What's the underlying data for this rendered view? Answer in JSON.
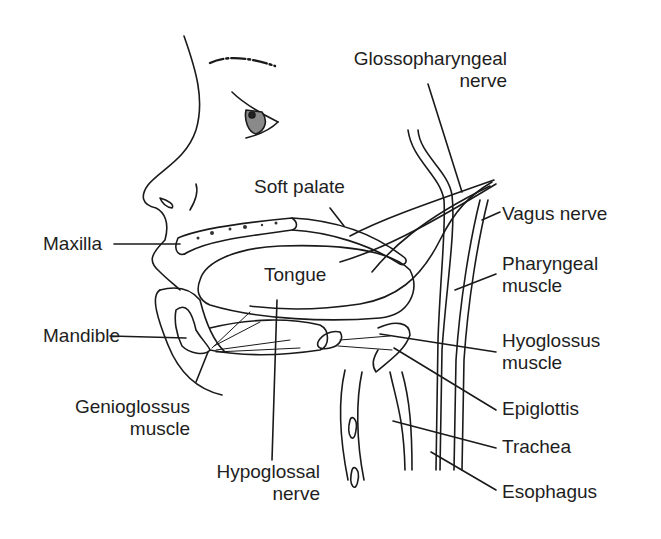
{
  "figure": {
    "background": "#ffffff",
    "line_color": "#1a1a1a"
  },
  "labels": {
    "glossopharyngeal_1": "Glossopharyngeal",
    "glossopharyngeal_2": "nerve",
    "soft_palate": "Soft palate",
    "vagus": "Vagus nerve",
    "maxilla": "Maxilla",
    "tongue": "Tongue",
    "pharyngeal_1": "Pharyngeal",
    "pharyngeal_2": "muscle",
    "mandible": "Mandible",
    "hyoglossus_1": "Hyoglossus",
    "hyoglossus_2": "muscle",
    "genioglossus_1": "Genioglossus",
    "genioglossus_2": "muscle",
    "epiglottis": "Epiglottis",
    "trachea": "Trachea",
    "hypoglossal_1": "Hypoglossal",
    "hypoglossal_2": "nerve",
    "esophagus": "Esophagus"
  }
}
